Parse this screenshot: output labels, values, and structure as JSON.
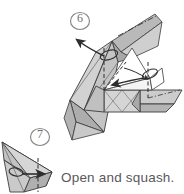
{
  "page": {
    "background_color": "#ffffff",
    "width": 184,
    "height": 194,
    "kind": "origami-instruction-diagram"
  },
  "steps": [
    {
      "number": "6",
      "marker": "circled-number",
      "position": {
        "x": 80,
        "y": 22
      },
      "description": "Large folded paper model shown three-quarter view with valley and mountain crease lines, a long outward pull arrow at upper left and a short fold arrow at the center.",
      "arrows": [
        {
          "name": "pull-out-arrow",
          "direction": "upper-left",
          "style": "solid-open-loop"
        },
        {
          "name": "fold-over-arrow",
          "direction": "lower-left",
          "style": "solid-open-loop"
        },
        {
          "name": "tuck-arrow",
          "direction": "right",
          "style": "small-loop"
        }
      ]
    },
    {
      "number": "7",
      "marker": "circled-number",
      "position": {
        "x": 40,
        "y": 138
      },
      "description": "Small narrow pointed flap with a vertical dashed valley crease and a short arrow pointing right.",
      "arrows": [
        {
          "name": "squash-arrow",
          "direction": "right",
          "style": "solid-loop"
        }
      ]
    }
  ],
  "caption": {
    "text": "Open and squash.",
    "color": "#58585a"
  },
  "colors": {
    "paper_front": "#ffffff",
    "paper_shade_light": "#d7d7d7",
    "paper_shade_mid": "#b9b9b9",
    "paper_shade_dark": "#9a9a9a",
    "outline": "#3c3c3c",
    "crease_line": "#4a4a4a",
    "text": "#58585a"
  }
}
